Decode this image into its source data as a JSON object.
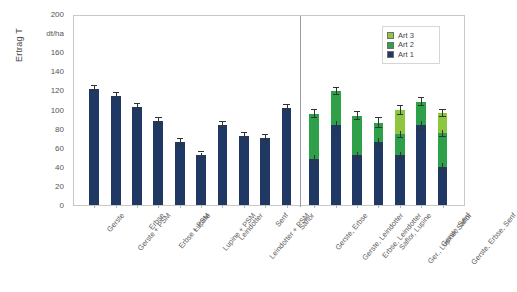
{
  "chart_data": {
    "type": "bar",
    "title": "",
    "xlabel": "",
    "ylabel": "Ertrag T",
    "unit_label": "dt/ha",
    "ylim": [
      0,
      200
    ],
    "ytick_step": 20,
    "yticks": [
      "0",
      "20",
      "40",
      "60",
      "80",
      "100",
      "120",
      "140",
      "160",
      "dt/ha",
      "200"
    ],
    "grid": false,
    "legend_position": "top-right",
    "legend": [
      "Art 3",
      "Art 2",
      "Art 1"
    ],
    "colors": {
      "art1": "#1f3864",
      "art2": "#2fa04a",
      "art3": "#8dc63f"
    },
    "categories": [
      "Gerste",
      "Gerste + PSM",
      "Erbse",
      "Erbse + PSM",
      "Lupine",
      "Lupine + PSM",
      "Leindotter",
      "Leindotter + PSM",
      "Senf",
      "Saflor",
      "Gerste, Erbse",
      "Gerste, Leindotter",
      "Erbse, Leindotter",
      "Saflor, Lupine",
      "Ger., Lupine, Saflor",
      "Gerste, Senf",
      "Gerste, Erbse, Senf"
    ],
    "series": [
      {
        "name": "Art 1",
        "values": [
          122,
          114,
          103,
          88,
          66,
          52,
          84,
          72,
          70,
          102,
          48,
          84,
          52,
          66,
          52,
          84,
          40
        ]
      },
      {
        "name": "Art 2",
        "values": [
          0,
          0,
          0,
          0,
          0,
          0,
          0,
          0,
          0,
          0,
          47,
          35,
          41,
          20,
          22,
          24,
          35
        ]
      },
      {
        "name": "Art 3",
        "values": [
          0,
          0,
          0,
          0,
          0,
          0,
          0,
          0,
          0,
          0,
          0,
          0,
          0,
          0,
          25,
          0,
          21
        ]
      }
    ],
    "errors": [
      {
        "value": 122,
        "err": 3
      },
      {
        "value": 114,
        "err": 3
      },
      {
        "value": 103,
        "err": 3
      },
      {
        "value": 88,
        "err": 3
      },
      {
        "value": 66,
        "err": 3
      },
      {
        "value": 52,
        "err": 3
      },
      {
        "value": 84,
        "err": 3
      },
      {
        "value": 72,
        "err": 3
      },
      {
        "value": 70,
        "err": 3
      },
      {
        "value": 102,
        "err": 3
      },
      {
        "value": 95,
        "err": 4
      },
      {
        "value": 119,
        "err": 4
      },
      {
        "value": 93,
        "err": 4
      },
      {
        "value": 86,
        "err": 5
      },
      {
        "value": 99,
        "err": 5
      },
      {
        "value": 108,
        "err": 4
      },
      {
        "value": 96,
        "err": 4
      }
    ],
    "group_divider_after_index": 9
  }
}
